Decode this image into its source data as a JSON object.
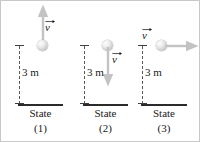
{
  "figure": {
    "background_color": "#ffffff",
    "border_color": "#c8c8c8",
    "ball_color": "#d2d2d2",
    "arrow_color": "#c3c3c3",
    "ground_color": "#2b2b2b",
    "dash_color": "#55595c",
    "text_color": "#1a1a1a"
  },
  "panels": [
    {
      "state_label": "State",
      "state_number": "(1)",
      "distance_label": "3 m",
      "velocity_label": "v",
      "velocity_direction": "up",
      "ball_position": "bottom-of-arrow"
    },
    {
      "state_label": "State",
      "state_number": "(2)",
      "distance_label": "3 m",
      "velocity_label": "v",
      "velocity_direction": "down",
      "ball_position": "top-of-arrow"
    },
    {
      "state_label": "State",
      "state_number": "(3)",
      "distance_label": "3 m",
      "velocity_label": "v",
      "velocity_direction": "right",
      "ball_position": "left-of-arrow"
    }
  ]
}
